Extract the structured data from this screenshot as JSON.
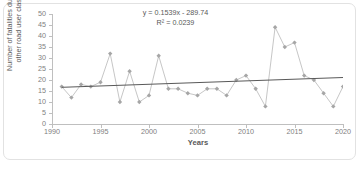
{
  "chart_data": {
    "type": "line",
    "title": "",
    "xlabel": "Years",
    "ylabel": "Number of fatalities due to other road user class",
    "xlim": [
      1990,
      2020
    ],
    "ylim": [
      0,
      50
    ],
    "ytick_step": 5,
    "xtick_step": 5,
    "xticks": [
      "1990",
      "1995",
      "2000",
      "2005",
      "2010",
      "2015",
      "2020"
    ],
    "yticks": [
      "0",
      "5",
      "10",
      "15",
      "20",
      "25",
      "30",
      "35",
      "40",
      "45",
      "50"
    ],
    "grid": false,
    "legend": "none",
    "marker": "diamond",
    "series": [
      {
        "name": "Fatalities - other road user class",
        "x": [
          1991,
          1992,
          1993,
          1994,
          1995,
          1996,
          1997,
          1998,
          1999,
          2000,
          2001,
          2002,
          2003,
          2004,
          2005,
          2006,
          2007,
          2008,
          2009,
          2010,
          2011,
          2012,
          2013,
          2014,
          2015,
          2016,
          2017,
          2018,
          2019,
          2020
        ],
        "values": [
          17,
          12,
          18,
          17,
          19,
          32,
          10,
          24,
          10,
          13,
          31,
          16,
          16,
          14,
          13,
          16,
          16,
          13,
          20,
          22,
          16,
          8,
          44,
          35,
          37,
          22,
          20,
          14,
          8,
          17
        ]
      }
    ],
    "trendline": {
      "type": "linear",
      "slope": 0.1539,
      "intercept": -289.74,
      "equation": "y = 0.1539x - 289.74",
      "r_squared_label": "R² = 0.0239",
      "r_squared": 0.0239
    },
    "colors": {
      "marker": "#a6a6a6",
      "line": "#bfbfbf",
      "trendline": "#595959",
      "axis": "#bfbfbf",
      "tick_text": "#808080",
      "title_text": "#595959",
      "background": "#ffffff",
      "frame_border": "#e2e2e2"
    }
  }
}
